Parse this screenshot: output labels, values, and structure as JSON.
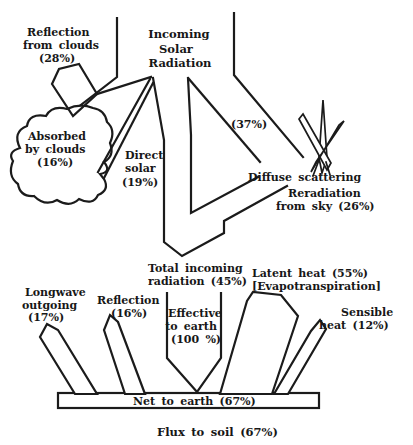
{
  "figure": {
    "type": "solar-radiation-flux-diagram",
    "colors": {
      "ink": "#1b1b1b",
      "background": "#ffffff"
    }
  },
  "labels": {
    "incoming_solar": {
      "lines": [
        "Incoming",
        "Solar",
        "Radiation"
      ]
    },
    "reflection_from_clouds": {
      "lines": [
        "Reflection",
        "from clouds",
        "(28%)"
      ]
    },
    "absorbed_by_clouds": {
      "lines": [
        "Absorbed",
        "by clouds",
        "(16%)"
      ]
    },
    "direct_solar": {
      "lines": [
        "Direct",
        "solar",
        "(19%)"
      ]
    },
    "scattered_fraction": {
      "lines": [
        "(37%)"
      ]
    },
    "diffuse_scattering": {
      "lines": [
        "Diffuse scattering"
      ]
    },
    "reradiation_from_sky": {
      "lines": [
        "Reradiation",
        "from sky (26%)"
      ]
    },
    "total_incoming": {
      "lines": [
        "Total incoming",
        "radiation (45%)"
      ]
    },
    "effective_to_earth": {
      "lines": [
        "Effective",
        "to earth",
        "(100 %)"
      ]
    },
    "longwave_outgoing": {
      "lines": [
        "Longwave",
        "outgoing",
        "(17%)"
      ]
    },
    "surface_reflection": {
      "lines": [
        "Reflection",
        "(16%)"
      ]
    },
    "latent_heat": {
      "lines": [
        "Latent heat (55%)",
        "[Evapotranspiration]"
      ]
    },
    "sensible_heat": {
      "lines": [
        "Sensible",
        "heat (12%)"
      ]
    },
    "net_to_earth": {
      "lines": [
        "Net to earth (67%)"
      ]
    },
    "flux_to_soil": {
      "lines": [
        "Flux to soil (67%)"
      ]
    }
  }
}
